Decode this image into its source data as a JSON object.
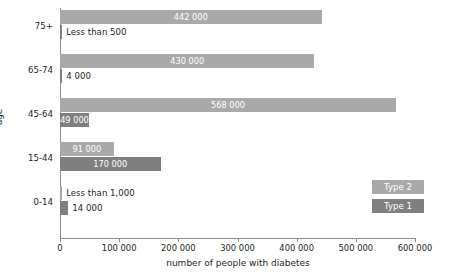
{
  "chart_data": {
    "type": "bar",
    "orientation": "horizontal",
    "title": "",
    "xlabel": "number of people with diabetes",
    "ylabel": "age",
    "xlim": [
      0,
      600000
    ],
    "xticks": [
      0,
      100000,
      200000,
      300000,
      400000,
      500000,
      600000
    ],
    "xtick_labels": [
      "0",
      "100 000",
      "200 000",
      "300 000",
      "400 000",
      "500 000",
      "600 000"
    ],
    "categories": [
      "0-14",
      "15-44",
      "45-64",
      "65-74",
      "75+"
    ],
    "grid": false,
    "legend_position": "right-inside",
    "series": [
      {
        "name": "Type 2",
        "color": "#a9a9a9",
        "values": [
          500,
          91000,
          568000,
          430000,
          442000
        ],
        "labels": [
          "Less than 1,000",
          "91 000",
          "49 000",
          "4 000",
          "442 000"
        ]
      },
      {
        "name": "Type 1",
        "color": "#7f7f7f",
        "values": [
          14000,
          170000,
          49000,
          4000,
          500
        ],
        "labels": [
          "14 000",
          "170 000",
          "49 000",
          "4 000",
          "Less than 500"
        ]
      }
    ],
    "bars": [
      {
        "category": "75+",
        "series": "Type 2",
        "value": 442000,
        "label": "442 000",
        "label_inside": true
      },
      {
        "category": "75+",
        "series": "Type 1",
        "value": 500,
        "label": "Less than 500",
        "label_inside": false
      },
      {
        "category": "65-74",
        "series": "Type 2",
        "value": 430000,
        "label": "430 000",
        "label_inside": true
      },
      {
        "category": "65-74",
        "series": "Type 1",
        "value": 4000,
        "label": "4 000",
        "label_inside": true
      },
      {
        "category": "45-64",
        "series": "Type 2",
        "value": 568000,
        "label": "568 000",
        "label_inside": true
      },
      {
        "category": "45-64",
        "series": "Type 1",
        "value": 49000,
        "label": "49 000",
        "label_inside": true
      },
      {
        "category": "15-44",
        "series": "Type 2",
        "value": 91000,
        "label": "91 000",
        "label_inside": true
      },
      {
        "category": "15-44",
        "series": "Type 1",
        "value": 170000,
        "label": "170 000",
        "label_inside": true
      },
      {
        "category": "0-14",
        "series": "Type 2",
        "value": 800,
        "label": "Less than 1,000",
        "label_inside": false
      },
      {
        "category": "0-14",
        "series": "Type 1",
        "value": 14000,
        "label": "14 000",
        "label_inside": false
      }
    ],
    "legend": [
      {
        "label": "Type 2",
        "color": "#a9a9a9"
      },
      {
        "label": "Type 1",
        "color": "#7f7f7f"
      }
    ]
  }
}
